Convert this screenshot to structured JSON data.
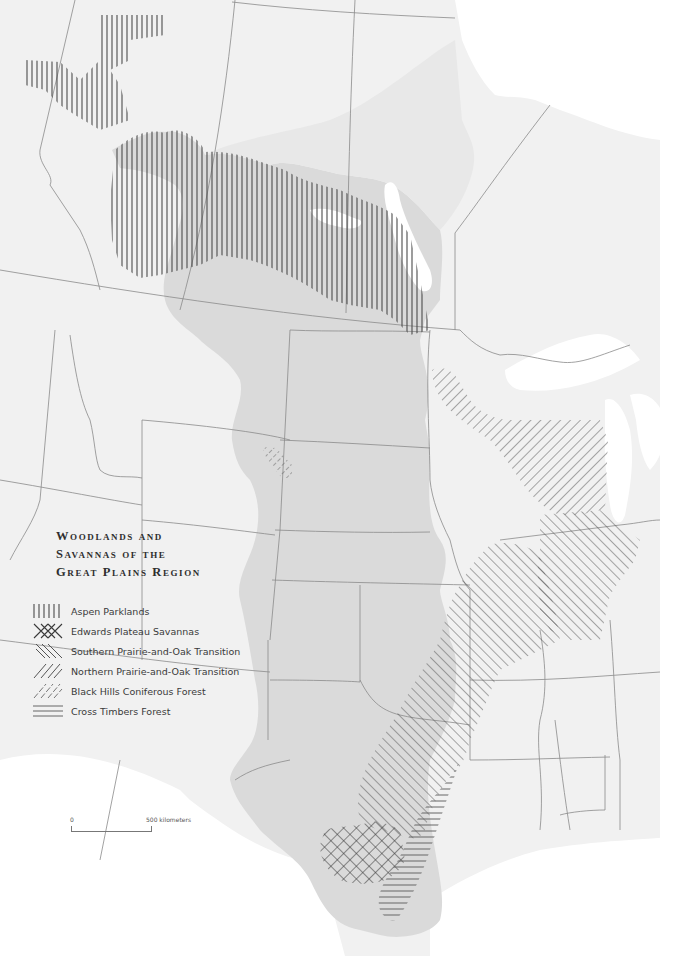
{
  "map": {
    "title_lines": [
      "Woodlands and",
      "Savannas of the",
      "Great Plains Region"
    ],
    "legend": {
      "items": [
        {
          "label": "Aspen Parklands",
          "pattern": "vertical-lines"
        },
        {
          "label": "Edwards Plateau Savannas",
          "pattern": "crosshatch"
        },
        {
          "label": "Southern Prairie-and-Oak Transition",
          "pattern": "diagonal-backslash"
        },
        {
          "label": "Northern Prairie-and-Oak Transition",
          "pattern": "diagonal-slash"
        },
        {
          "label": "Black Hills Coniferous Forest",
          "pattern": "diagonal-slash-light"
        },
        {
          "label": "Cross Timbers Forest",
          "pattern": "horizontal-lines"
        }
      ]
    },
    "scale_bar": {
      "start_label": "0",
      "end_label": "500  kilometers"
    },
    "colors": {
      "background": "#f4f4f4",
      "great_plains_fill": "#dcdcdc",
      "water": "#ffffff",
      "boundary": "#8a8a8a",
      "hatch": "#555555"
    }
  }
}
